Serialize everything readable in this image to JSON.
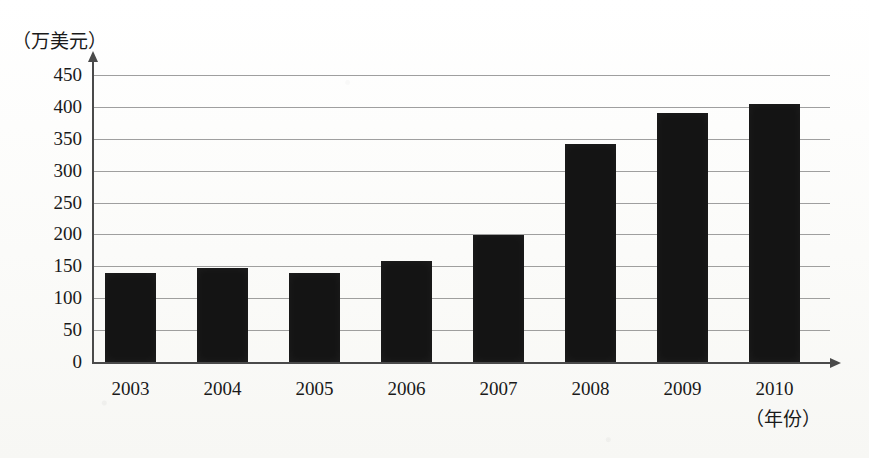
{
  "chart_data": {
    "type": "bar",
    "title": "",
    "subtitle": "",
    "xlabel": "（年份）",
    "ylabel": "（万美元）",
    "categories": [
      "2003",
      "2004",
      "2005",
      "2006",
      "2007",
      "2008",
      "2009",
      "2010"
    ],
    "values": [
      140,
      147,
      140,
      158,
      199,
      342,
      390,
      405
    ],
    "ylim": [
      0,
      450
    ],
    "ytick_labels": [
      "0",
      "50",
      "100",
      "150",
      "200",
      "250",
      "300",
      "350",
      "400",
      "450"
    ],
    "ytick_values": [
      0,
      50,
      100,
      150,
      200,
      250,
      300,
      350,
      400,
      450
    ],
    "grid": true,
    "legend": null,
    "bar_color": "#141414",
    "grid_color": "#8e8e8e",
    "axis_color": "#4a4a4a"
  }
}
